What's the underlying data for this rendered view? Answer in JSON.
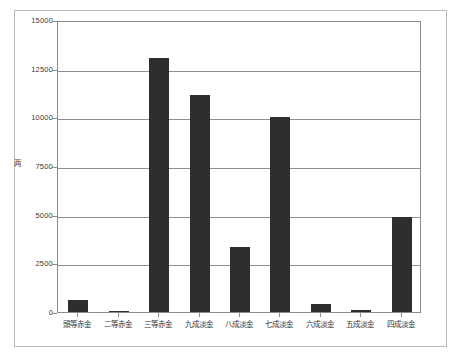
{
  "chart_data": {
    "type": "bar",
    "title": "",
    "xlabel": "",
    "ylabel": "两",
    "ylim": [
      0,
      15000
    ],
    "grid": true,
    "legend": "none",
    "yticks": [
      0,
      2500,
      5000,
      7500,
      10000,
      12500,
      15000
    ],
    "ytick_labels": [
      "0",
      "2500",
      "5000",
      "7500",
      "10000",
      "12500",
      "15000"
    ],
    "bar_color": "#2e2e2e",
    "categories": [
      "頭等赤金",
      "二等赤金",
      "三等赤金",
      "九成淡金",
      "八成淡金",
      "七成淡金",
      "六成淡金",
      "五成淡金",
      "四成淡金"
    ],
    "values": [
      620,
      60,
      13050,
      11150,
      3350,
      10000,
      420,
      90,
      4900
    ]
  }
}
